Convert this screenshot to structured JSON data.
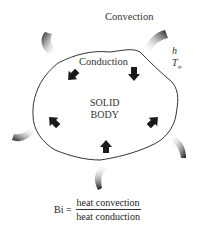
{
  "diagram": {
    "labels": {
      "convection": "Convection",
      "conduction": "Conduction",
      "h": "h",
      "t_inf_base": "T",
      "t_inf_sub": "∞",
      "solid_line1": "SOLID",
      "solid_line2": "BODY"
    },
    "formula": {
      "lhs": "Bi =",
      "numerator": "heat convection",
      "denominator": "heat conduction"
    },
    "colors": {
      "outline": "#333333",
      "arrow": "#1a1a1a",
      "background": "#ffffff"
    },
    "convection_arrows": 5,
    "conduction_arrows": 5
  }
}
